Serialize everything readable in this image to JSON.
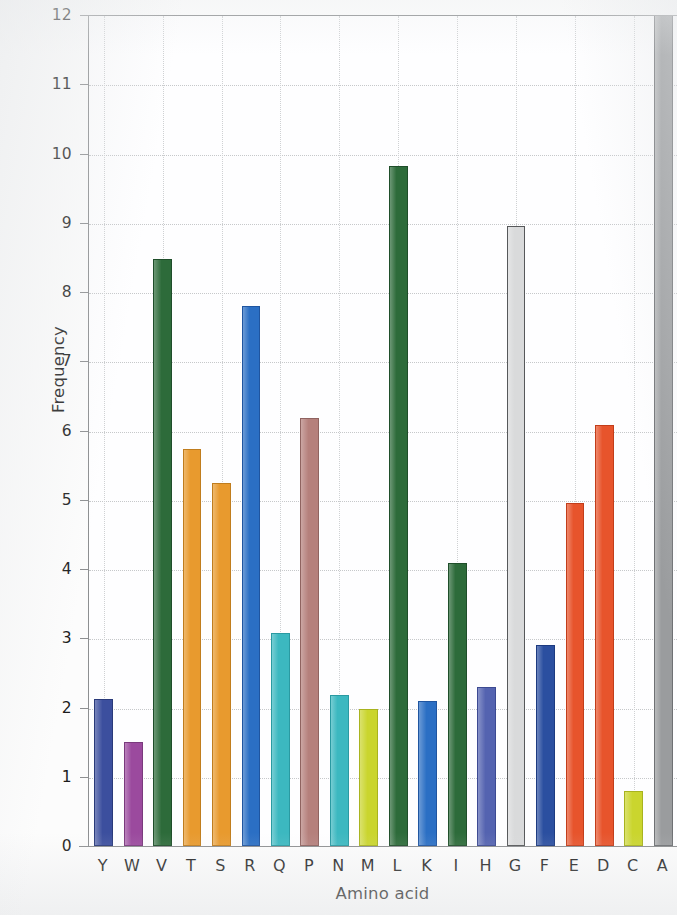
{
  "figure": {
    "background_color": "#fcfcfc",
    "plot_background_color": "#fefeff",
    "axis_color": "#8d8f91",
    "grid_color": "#c6c8ca",
    "text_color": "#1c1c1c"
  },
  "chart_data": {
    "type": "bar",
    "title": "",
    "xlabel": "Amino acid",
    "ylabel": "Frequency",
    "categories": [
      "Y",
      "W",
      "V",
      "T",
      "S",
      "R",
      "Q",
      "P",
      "N",
      "M",
      "L",
      "K",
      "I",
      "H",
      "G",
      "F",
      "E",
      "D",
      "C",
      "A"
    ],
    "values": [
      2.12,
      1.5,
      8.47,
      5.74,
      5.24,
      7.8,
      3.08,
      6.18,
      2.18,
      1.98,
      9.82,
      2.1,
      4.08,
      2.29,
      8.95,
      2.9,
      4.96,
      6.08,
      0.8,
      12.0
    ],
    "bar_colors": [
      "#3c4f9e",
      "#9b4a9e",
      "#2d6b3a",
      "#e89a2e",
      "#e89a2e",
      "#2b6fc4",
      "#3cb8c0",
      "#b5807c",
      "#3cb8c0",
      "#cad52e",
      "#2d6b3a",
      "#2b6fc4",
      "#2d6b3a",
      "#5463b0",
      "#d9dadb",
      "#2b4fa0",
      "#e7542c",
      "#e7542c",
      "#cad52e",
      "#9a9c9e"
    ],
    "bar_edge_colors": [
      "#2a3a7a",
      "#7a3a7d",
      "#1f4e2a",
      "#c07d1e",
      "#c07d1e",
      "#1f55a0",
      "#2a9aa2",
      "#8f6360",
      "#2a9aa2",
      "#a8b31f",
      "#1f4e2a",
      "#1f55a0",
      "#1f4e2a",
      "#3c4a92",
      "#56585a",
      "#1c3a80",
      "#c23d1a",
      "#c23d1a",
      "#a8b31f",
      "#6f7174"
    ],
    "ylim": [
      0,
      12
    ],
    "yticks": [
      0,
      1,
      2,
      3,
      4,
      5,
      6,
      7,
      8,
      9,
      10,
      11,
      12
    ],
    "ytick_labels": [
      "0",
      "1",
      "2",
      "3",
      "4",
      "5",
      "6",
      "7",
      "8",
      "9",
      "10",
      "11",
      "12"
    ],
    "grid": true,
    "grid_axis": "both",
    "legend": false
  }
}
